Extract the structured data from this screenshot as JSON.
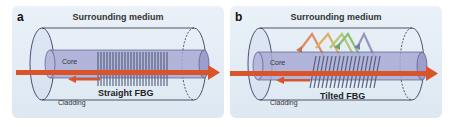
{
  "panels": [
    {
      "id": "a",
      "label": "a",
      "medium_label": "Surrounding medium",
      "core_label": "Core",
      "cladding_label": "Cladding",
      "grating_label": "Straight FBG",
      "grating_type": "straight"
    },
    {
      "id": "b",
      "label": "b",
      "medium_label": "Surrounding medium",
      "core_label": "Core",
      "cladding_label": "Cladding",
      "grating_label": "Tilted FBG",
      "grating_type": "tilted",
      "cladding_mode_colors": [
        "#e07a4a",
        "#d9a84a",
        "#7ab860",
        "#8a8ab8"
      ]
    }
  ],
  "colors": {
    "arrow": "#d9542b",
    "core": "#8f93c4",
    "panel_bg": "#e3ecf5",
    "outline": "#2a2a4a"
  }
}
